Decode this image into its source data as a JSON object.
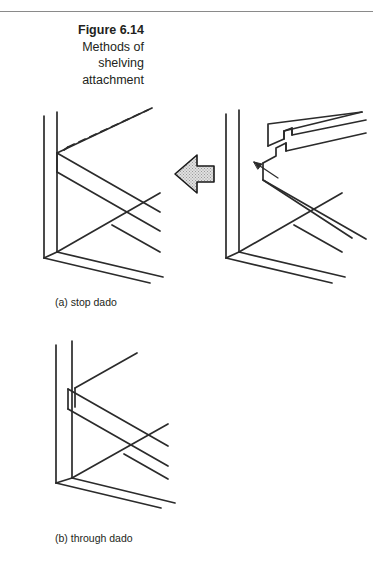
{
  "figure": {
    "number_label": "Figure 6.14",
    "title_lines": [
      "Methods of",
      "shelving",
      "attachment"
    ]
  },
  "panels": [
    {
      "id": "panel-a",
      "label": "(a) stop dado",
      "description": "Isometric view of a cabinet side panel with a stopped dado; shelf stops short of the front edge, hidden dado shown dashed.",
      "arrow": {
        "name": "assembly-direction-arrow",
        "direction": "left",
        "fill": "#d9d9d9",
        "stroke": "#1a1a1a"
      },
      "detail_arrow": {
        "name": "joint-callout-arrow",
        "direction": "up-left"
      }
    },
    {
      "id": "panel-b",
      "label": "(b) through dado",
      "description": "Isometric view of a cabinet side panel with a through dado; the groove and shelf run the full depth to the front edge."
    }
  ],
  "style": {
    "line_color": "#2b2b2b",
    "rule_color": "#8a8a8a",
    "background": "#ffffff",
    "text_color": "#231f20"
  }
}
